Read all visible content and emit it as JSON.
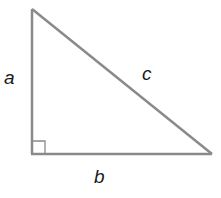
{
  "diagram": {
    "type": "right-triangle",
    "stroke_color": "#8a8a8a",
    "label_color": "#1a1a1a",
    "vertices": {
      "top": [
        32,
        9
      ],
      "right_angle": [
        32,
        154
      ],
      "right": [
        212,
        154
      ]
    },
    "labels": {
      "a": "a",
      "b": "b",
      "c": "c"
    },
    "right_angle_marker": true
  }
}
